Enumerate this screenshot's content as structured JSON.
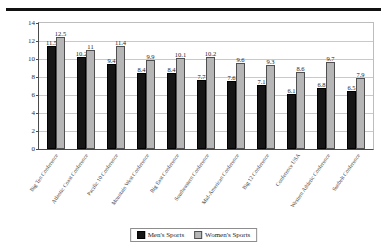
{
  "chart_data": {
    "type": "bar",
    "title": "",
    "xlabel": "",
    "ylabel": "",
    "ylim": [
      0,
      14
    ],
    "yticks": [
      0,
      2,
      4,
      6,
      8,
      10,
      12,
      14
    ],
    "grid": true,
    "legend_position": "bottom",
    "categories": [
      "Big Ten Conference",
      "Atlantic Coast Conference",
      "Pacific 10 Conference",
      "Mountain West Conference",
      "Big East Conference",
      "Southeastern Conference",
      "Mid-American Conference",
      "Big 12 Conference",
      "Conference USA",
      "Western Athletic Conference",
      "Sunbelt Conference"
    ],
    "series": [
      {
        "name": "Men's Sports",
        "color": "#161616",
        "values": [
          11.5,
          10.2,
          9.4,
          8.4,
          8.4,
          7.7,
          7.6,
          7.1,
          6.1,
          6.8,
          6.5
        ]
      },
      {
        "name": "Women's Sports",
        "color": "#b6b6b6",
        "values": [
          12.5,
          11.0,
          11.4,
          9.9,
          10.1,
          10.2,
          9.6,
          9.3,
          8.6,
          9.7,
          7.9
        ]
      }
    ]
  },
  "legend": {
    "men_label": "Men's Sports",
    "women_label": "Women's Sports"
  }
}
